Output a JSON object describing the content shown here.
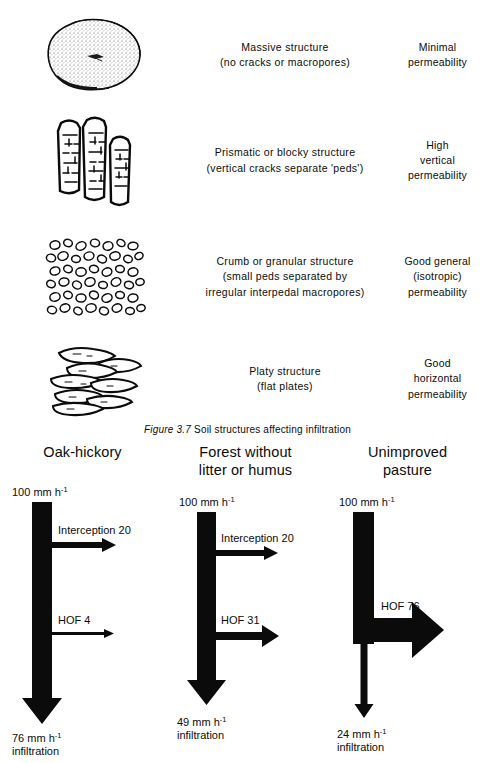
{
  "figure": {
    "caption_label": "Figure 3.7",
    "caption_text": "Soil structures affecting infiltration"
  },
  "soil_structures": {
    "rows": [
      {
        "icon": "massive-soil-ped-illustration",
        "desc_line1": "Massive structure",
        "desc_line2": "(no cracks or macropores)",
        "desc_line3": "",
        "perm_line1": "Minimal",
        "perm_line2": "permeability",
        "perm_line3": ""
      },
      {
        "icon": "prismatic-blocky-peds-illustration",
        "desc_line1": "Prismatic or blocky structure",
        "desc_line2": "(vertical cracks separate 'peds')",
        "desc_line3": "",
        "perm_line1": "High",
        "perm_line2": "vertical",
        "perm_line3": "permeability"
      },
      {
        "icon": "crumb-granular-peds-illustration",
        "desc_line1": "Crumb or granular structure",
        "desc_line2": "(small peds separated by",
        "desc_line3": "irregular interpedal macropores)",
        "perm_line1": "Good general",
        "perm_line2": "(isotropic)",
        "perm_line3": "permeability"
      },
      {
        "icon": "platy-plates-illustration",
        "desc_line1": "Platy structure",
        "desc_line2": "(flat plates)",
        "desc_line3": "",
        "perm_line1": "Good",
        "perm_line2": "horizontal",
        "perm_line3": "permeability"
      }
    ]
  },
  "infiltration_diagrams": {
    "units": "mm h",
    "unit_exponent": "-1",
    "columns": [
      {
        "title_line1": "Oak-hickory",
        "title_line2": "",
        "input_value": "100",
        "input_label": "100 mm h",
        "branches": [
          {
            "label": "Interception 20",
            "value": 20
          },
          {
            "label": "HOF 4",
            "value": 4
          }
        ],
        "output_label": "76 mm h",
        "output_value": "76",
        "output_caption": "infiltration"
      },
      {
        "title_line1": "Forest without",
        "title_line2": "litter or humus",
        "input_value": "100",
        "input_label": "100 mm h",
        "branches": [
          {
            "label": "Interception 20",
            "value": 20
          },
          {
            "label": "HOF 31",
            "value": 31
          }
        ],
        "output_label": "49 mm h",
        "output_value": "49",
        "output_caption": "infiltration"
      },
      {
        "title_line1": "Unimproved",
        "title_line2": "pasture",
        "input_value": "100",
        "input_label": "100 mm h",
        "branches": [
          {
            "label": "HOF 76",
            "value": 76
          }
        ],
        "output_label": "24 mm h",
        "output_value": "24",
        "output_caption": "infiltration"
      }
    ]
  },
  "chart_data": {
    "type": "diagram",
    "title": "Soil structures affecting infiltration",
    "series": [
      {
        "name": "Oak-hickory",
        "rainfall": 100,
        "interception": 20,
        "hof": 4,
        "infiltration": 76
      },
      {
        "name": "Forest without litter or humus",
        "rainfall": 100,
        "interception": 20,
        "hof": 31,
        "infiltration": 49
      },
      {
        "name": "Unimproved pasture",
        "rainfall": 100,
        "interception": 0,
        "hof": 76,
        "infiltration": 24
      }
    ],
    "units": "mm h-1"
  },
  "colors": {
    "ink": "#0b0b0b",
    "paper": "#ffffff"
  }
}
